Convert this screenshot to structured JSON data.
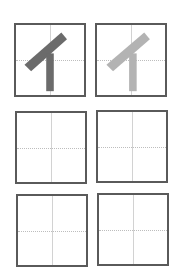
{
  "worksheet": {
    "character": "イ",
    "boxes": [
      {
        "id": 1,
        "content": "イ",
        "style": "model",
        "stroke_color": "#6b6b6b"
      },
      {
        "id": 2,
        "content": "イ",
        "style": "trace",
        "stroke_color": "#b3b3b3"
      },
      {
        "id": 3,
        "content": "",
        "style": "blank"
      },
      {
        "id": 4,
        "content": "",
        "style": "blank"
      },
      {
        "id": 5,
        "content": "",
        "style": "blank"
      },
      {
        "id": 6,
        "content": "",
        "style": "blank"
      }
    ],
    "colors": {
      "border": "#5a5a5a",
      "guide_line": "#cccccc",
      "model_stroke": "#6b6b6b",
      "trace_stroke": "#b3b3b3"
    }
  }
}
